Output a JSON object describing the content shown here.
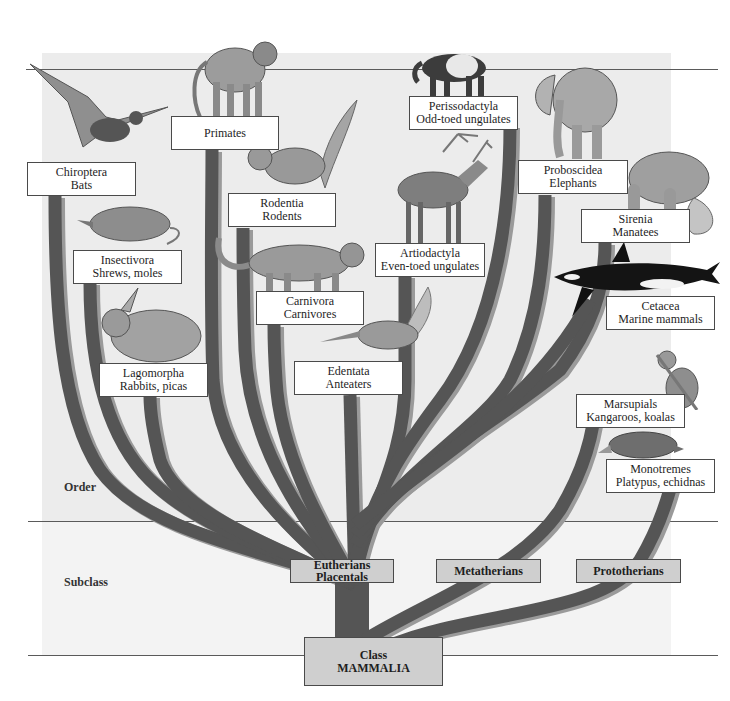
{
  "figure": {
    "colors": {
      "branch": "#555555",
      "branch_shadow": "#9a9a9a",
      "order_panel": "#ececec",
      "subclass_panel": "#f3f3f3",
      "subclass_box": "#cfcfcf",
      "label_box": "#ffffff",
      "rule": "#5a5a5a"
    }
  },
  "ranks": {
    "order": "Order",
    "subclass": "Subclass"
  },
  "class_node": {
    "line1": "Class",
    "line2": "MAMMALIA"
  },
  "subclasses": [
    {
      "line1": "Eutherians",
      "line2": "Placentals"
    },
    {
      "line1": "Metatherians",
      "line2": ""
    },
    {
      "line1": "Prototherians",
      "line2": ""
    }
  ],
  "orders": [
    {
      "name": "Chiroptera",
      "common": "Bats",
      "icon": "bat-icon",
      "subclass": "Eutherians"
    },
    {
      "name": "Primates",
      "common": "",
      "icon": "baboon-icon",
      "subclass": "Eutherians"
    },
    {
      "name": "Rodentia",
      "common": "Rodents",
      "icon": "squirrel-icon",
      "subclass": "Eutherians"
    },
    {
      "name": "Insectivora",
      "common": "Shrews, moles",
      "icon": "shrew-icon",
      "subclass": "Eutherians"
    },
    {
      "name": "Carnivora",
      "common": "Carnivores",
      "icon": "cougar-icon",
      "subclass": "Eutherians"
    },
    {
      "name": "Lagomorpha",
      "common": "Rabbits, picas",
      "icon": "rabbit-icon",
      "subclass": "Eutherians"
    },
    {
      "name": "Edentata",
      "common": "Anteaters",
      "icon": "anteater-icon",
      "subclass": "Eutherians"
    },
    {
      "name": "Perissodactyla",
      "common": "Odd-toed ungulates",
      "icon": "tapir-icon",
      "subclass": "Eutherians"
    },
    {
      "name": "Artiodactyla",
      "common": "Even-toed ungulates",
      "icon": "elk-icon",
      "subclass": "Eutherians"
    },
    {
      "name": "Proboscidea",
      "common": "Elephants",
      "icon": "elephant-icon",
      "subclass": "Eutherians"
    },
    {
      "name": "Sirenia",
      "common": "Manatees",
      "icon": "manatee-icon",
      "subclass": "Eutherians"
    },
    {
      "name": "Cetacea",
      "common": "Marine mammals",
      "icon": "orca-icon",
      "subclass": "Eutherians"
    },
    {
      "name": "Marsupials",
      "common": "Kangaroos, koalas",
      "icon": "koala-icon",
      "subclass": "Metatherians"
    },
    {
      "name": "Monotremes",
      "common": "Platypus, echidnas",
      "icon": "platypus-icon",
      "subclass": "Prototherians"
    }
  ]
}
